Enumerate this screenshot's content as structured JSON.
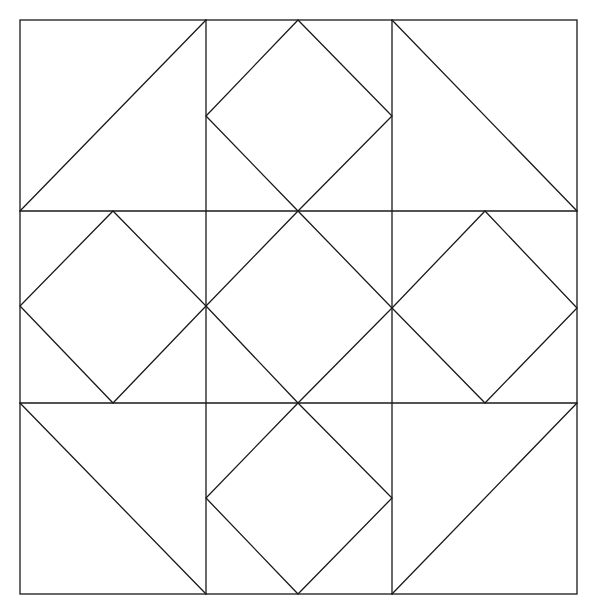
{
  "diagram": {
    "type": "quilt-block-pattern",
    "grid": {
      "rows": 3,
      "cols": 3
    },
    "stroke_color": "#1a1a1a",
    "background_color": "#ffffff",
    "outer_square": {
      "x1": 20,
      "y1": 20,
      "x2": 577,
      "y2": 594
    },
    "grid_lines": {
      "vertical": [
        {
          "x": 206,
          "y1": 20,
          "y2": 594
        },
        {
          "x": 392,
          "y1": 20,
          "y2": 594
        }
      ],
      "horizontal": [
        {
          "y": 211,
          "x1": 20,
          "x2": 577
        },
        {
          "y": 403,
          "x1": 20,
          "x2": 577
        }
      ]
    },
    "cells": [
      {
        "id": "top-left",
        "kind": "half-square-triangle",
        "diagonal": [
          [
            20,
            211
          ],
          [
            206,
            20
          ]
        ]
      },
      {
        "id": "top-center",
        "kind": "square-in-square",
        "diamond": [
          [
            298,
            20
          ],
          [
            392,
            116
          ],
          [
            298,
            211
          ],
          [
            206,
            116
          ]
        ]
      },
      {
        "id": "top-right",
        "kind": "half-square-triangle",
        "diagonal": [
          [
            392,
            20
          ],
          [
            577,
            211
          ]
        ]
      },
      {
        "id": "middle-left",
        "kind": "square-in-square",
        "diamond": [
          [
            113,
            211
          ],
          [
            206,
            306
          ],
          [
            113,
            403
          ],
          [
            20,
            306
          ]
        ]
      },
      {
        "id": "middle-center",
        "kind": "square-in-square",
        "diamond": [
          [
            298,
            211
          ],
          [
            392,
            308
          ],
          [
            298,
            403
          ],
          [
            206,
            306
          ]
        ]
      },
      {
        "id": "middle-right",
        "kind": "square-in-square",
        "diamond": [
          [
            485,
            211
          ],
          [
            577,
            308
          ],
          [
            485,
            403
          ],
          [
            392,
            308
          ]
        ]
      },
      {
        "id": "bottom-left",
        "kind": "half-square-triangle",
        "diagonal": [
          [
            20,
            403
          ],
          [
            206,
            594
          ]
        ]
      },
      {
        "id": "bottom-center",
        "kind": "square-in-square",
        "diamond": [
          [
            298,
            403
          ],
          [
            392,
            498
          ],
          [
            298,
            594
          ],
          [
            206,
            498
          ]
        ]
      },
      {
        "id": "bottom-right",
        "kind": "half-square-triangle",
        "diagonal": [
          [
            392,
            594
          ],
          [
            577,
            403
          ]
        ]
      }
    ]
  }
}
